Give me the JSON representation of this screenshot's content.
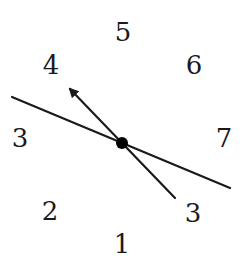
{
  "diagram": {
    "labels": [
      {
        "id": "label-5",
        "text": "5",
        "x": 123,
        "y": 32
      },
      {
        "id": "label-4",
        "text": "4",
        "x": 51,
        "y": 65
      },
      {
        "id": "label-6",
        "text": "6",
        "x": 194,
        "y": 65
      },
      {
        "id": "label-3-left",
        "text": "3",
        "x": 20,
        "y": 138
      },
      {
        "id": "label-7",
        "text": "7",
        "x": 224,
        "y": 138
      },
      {
        "id": "label-2",
        "text": "2",
        "x": 50,
        "y": 211
      },
      {
        "id": "label-3-right",
        "text": "3",
        "x": 193,
        "y": 213
      },
      {
        "id": "label-1",
        "text": "1",
        "x": 122,
        "y": 244
      }
    ],
    "center_point": {
      "x": 122,
      "y": 143,
      "r": 6
    },
    "long_line": {
      "x1": 12,
      "y1": 97,
      "x2": 230,
      "y2": 188
    },
    "arrow_line": {
      "x1": 175,
      "y1": 198,
      "x2": 68,
      "y2": 87
    },
    "stroke_color": "#1a1a1a"
  }
}
